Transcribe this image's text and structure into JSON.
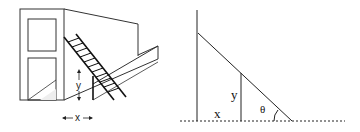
{
  "figure": {
    "left_panel": {
      "description": "Perspective drawing of building with ladder leaning over a fence",
      "labels": {
        "height": "y",
        "distance": "x"
      }
    },
    "right_panel": {
      "description": "Geometric model of ladder over fence",
      "labels": {
        "distance": "x",
        "height": "y",
        "angle": "θ"
      }
    }
  },
  "colors": {
    "stroke": "#222222",
    "light_stroke": "#555555",
    "background": "#ffffff"
  }
}
